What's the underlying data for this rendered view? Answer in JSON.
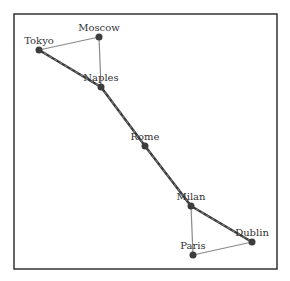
{
  "graph": {
    "frame": {
      "x": 14,
      "y": 14,
      "width": 263,
      "height": 255
    },
    "colors": {
      "node": "#3d3d3d",
      "edge": "#8a8a8a",
      "path": "#3a3a3a",
      "frame": "#333333"
    },
    "nodes": [
      {
        "id": "Tokyo",
        "label": "Tokyo",
        "x": 39,
        "y": 50
      },
      {
        "id": "Moscow",
        "label": "Moscow",
        "x": 99,
        "y": 37
      },
      {
        "id": "Naples",
        "label": "Naples",
        "x": 101,
        "y": 87
      },
      {
        "id": "Rome",
        "label": "Rome",
        "x": 145,
        "y": 146
      },
      {
        "id": "Milan",
        "label": "Milan",
        "x": 191,
        "y": 206
      },
      {
        "id": "Dublin",
        "label": "Dublin",
        "x": 252,
        "y": 242
      },
      {
        "id": "Paris",
        "label": "Paris",
        "x": 193,
        "y": 255
      }
    ],
    "edges": [
      {
        "from": "Tokyo",
        "to": "Moscow",
        "highlighted": false
      },
      {
        "from": "Moscow",
        "to": "Naples",
        "highlighted": false
      },
      {
        "from": "Tokyo",
        "to": "Naples",
        "highlighted": true
      },
      {
        "from": "Naples",
        "to": "Rome",
        "highlighted": true
      },
      {
        "from": "Rome",
        "to": "Milan",
        "highlighted": true
      },
      {
        "from": "Milan",
        "to": "Dublin",
        "highlighted": true
      },
      {
        "from": "Milan",
        "to": "Paris",
        "highlighted": false
      },
      {
        "from": "Paris",
        "to": "Dublin",
        "highlighted": false
      }
    ]
  }
}
